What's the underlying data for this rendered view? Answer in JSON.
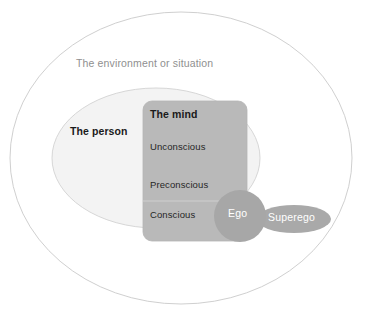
{
  "diagram": {
    "environment": {
      "label": "The environment or situation",
      "shape": "ellipse",
      "fill": "#ffffff",
      "stroke": "#c9c9c9",
      "cx": 181,
      "cy": 158,
      "rx": 172,
      "ry": 146
    },
    "person": {
      "label": "The person",
      "shape": "ellipse",
      "fill": "#f2f2f2",
      "stroke": "#cfcfcf",
      "cx": 156,
      "cy": 158,
      "rx": 104,
      "ry": 70
    },
    "mind": {
      "label": "The mind",
      "shape": "rounded-rect",
      "fill": "#b9b9b9",
      "stroke": "#b0b0b0",
      "x": 143,
      "y": 101,
      "width": 104,
      "height": 140,
      "radius": 9,
      "levels": [
        {
          "label": "Unconscious"
        },
        {
          "label": "Preconscious"
        },
        {
          "label": "Conscious"
        }
      ],
      "divider_color": "#cdcdcd"
    },
    "ego": {
      "label": "Ego",
      "shape": "circle",
      "fill": "#a7a7a7",
      "cx": 240,
      "cy": 216,
      "r": 26
    },
    "superego": {
      "label": "Superego",
      "shape": "ellipse",
      "fill": "#a9a9a9",
      "cx": 294,
      "cy": 219,
      "rx": 37,
      "ry": 14
    }
  }
}
